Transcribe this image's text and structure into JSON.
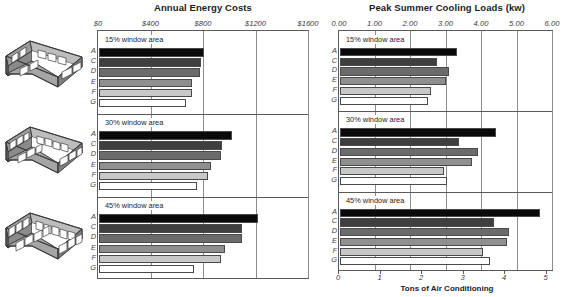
{
  "figure": {
    "building_icons": [
      {
        "name": "building-15-window-area",
        "windows_long": 3,
        "windows_short": 2
      },
      {
        "name": "building-30-window-area",
        "windows_long": 4,
        "windows_short": 3
      },
      {
        "name": "building-45-window-area",
        "windows_long": 5,
        "windows_short": 3
      }
    ],
    "series_labels": [
      "A",
      "C",
      "D",
      "E",
      "F",
      "G"
    ],
    "series_colors": [
      "#0a0a0a",
      "#3f3f3f",
      "#6b6b6b",
      "#8f8f8f",
      "#c8c8c8",
      "#ffffff"
    ],
    "group_labels": [
      "15% window area",
      "30% window area",
      "45% window area"
    ]
  },
  "chart_data": [
    {
      "type": "bar",
      "title": "Annual Energy Costs",
      "xlabel": "",
      "ylabel": "",
      "orientation": "horizontal",
      "axis_position": "top",
      "xlim": [
        0,
        1600
      ],
      "xticks": [
        0,
        400,
        800,
        1200,
        1600
      ],
      "xticklabels": [
        "$0",
        "$400",
        "$800",
        "$1200",
        "$1600"
      ],
      "grid": true,
      "categories": [
        "A",
        "C",
        "D",
        "E",
        "F",
        "G"
      ],
      "groups": [
        {
          "name": "15% window area",
          "values": [
            800,
            780,
            770,
            705,
            705,
            660
          ]
        },
        {
          "name": "30% window area",
          "values": [
            1010,
            940,
            930,
            850,
            830,
            745
          ]
        },
        {
          "name": "45% window area",
          "values": [
            1210,
            1090,
            1090,
            960,
            930,
            725
          ]
        }
      ]
    },
    {
      "type": "bar",
      "title": "Peak Summer Cooling Loads (kw)",
      "xlabel": "Tons of Air Conditioning",
      "ylabel": "",
      "orientation": "horizontal",
      "axis_position": "top",
      "xlim": [
        0,
        6
      ],
      "xticks": [
        0,
        1,
        2,
        3,
        4,
        5,
        6
      ],
      "xticklabels": [
        "0.00",
        "1.00",
        "2.00",
        "3.00",
        "4.00",
        "5.00",
        "6.00"
      ],
      "secondary_axis": {
        "position": "bottom",
        "label": "Tons of Air Conditioning",
        "ticks": [
          0,
          1,
          2,
          3,
          4,
          5
        ],
        "ticklabels": [
          "0",
          "1",
          "2",
          "3",
          "4",
          "5"
        ],
        "unit_ratio_kw_per_ton": 1.17
      },
      "grid": true,
      "categories": [
        "A",
        "C",
        "D",
        "E",
        "F",
        "G"
      ],
      "groups": [
        {
          "name": "15% window area",
          "values": [
            3.3,
            2.73,
            3.07,
            2.99,
            2.57,
            2.49
          ]
        },
        {
          "name": "30% window area",
          "values": [
            4.4,
            3.35,
            3.9,
            3.71,
            2.93,
            3.0
          ]
        },
        {
          "name": "45% window area",
          "values": [
            5.63,
            4.35,
            4.76,
            4.71,
            4.03,
            4.22
          ]
        }
      ]
    }
  ]
}
